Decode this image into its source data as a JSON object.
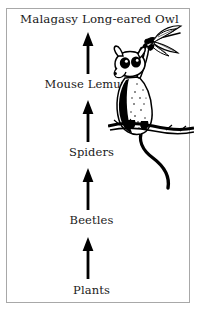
{
  "figure": {
    "type": "food-chain-diagram",
    "orientation": "vertical-bottom-up",
    "frame_color": "#a8a8a8",
    "background_color": "#ffffff",
    "ink_color": "#000000"
  },
  "chain": {
    "levels": [
      {
        "label": "Malagasy Long-eared Owl",
        "rank": 5,
        "role": "top predator"
      },
      {
        "label": "Mouse Lemur",
        "rank": 4,
        "role": "predator"
      },
      {
        "label": "Spiders",
        "rank": 3,
        "role": "predator"
      },
      {
        "label": "Beetles",
        "rank": 2,
        "role": "herbivore"
      },
      {
        "label": "Plants",
        "rank": 1,
        "role": "producer"
      }
    ],
    "arrow_count": 4,
    "arrow_direction": "up",
    "arrow_meaning": "energy flows to"
  },
  "illustration": {
    "subject": "mouse lemur catching a dragonfly",
    "elements": [
      "dragonfly",
      "mouse-lemur",
      "tree-branch",
      "lemur-tail"
    ],
    "style": "pen and ink line drawing"
  }
}
